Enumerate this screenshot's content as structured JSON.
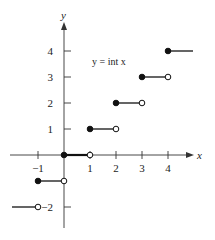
{
  "chart_data": {
    "type": "line",
    "title": "y = int x",
    "xlabel": "x",
    "ylabel": "y",
    "xlim": [
      -2,
      4.7
    ],
    "ylim": [
      -2.5,
      5
    ],
    "grid": false,
    "x_ticks": [
      -1,
      1,
      2,
      3,
      4
    ],
    "x_tick_labels": [
      "−1",
      "1",
      "2",
      "3",
      "4"
    ],
    "y_ticks": [
      1,
      2,
      3,
      4,
      -2
    ],
    "y_tick_labels": [
      "1",
      "2",
      "3",
      "4",
      "−2"
    ],
    "segments": [
      {
        "x_start": -2,
        "x_end": -1,
        "y": -2,
        "left_closed": false,
        "right_closed": false,
        "left_visible": false
      },
      {
        "x_start": -1,
        "x_end": 0,
        "y": -1,
        "left_closed": true,
        "right_closed": false
      },
      {
        "x_start": 0,
        "x_end": 1,
        "y": 0,
        "left_closed": true,
        "right_closed": false
      },
      {
        "x_start": 1,
        "x_end": 2,
        "y": 1,
        "left_closed": true,
        "right_closed": false
      },
      {
        "x_start": 2,
        "x_end": 3,
        "y": 2,
        "left_closed": true,
        "right_closed": false
      },
      {
        "x_start": 3,
        "x_end": 4,
        "y": 3,
        "left_closed": true,
        "right_closed": false
      },
      {
        "x_start": 4,
        "x_end": 5,
        "y": 4,
        "left_closed": true,
        "right_closed": false,
        "right_visible": false
      }
    ],
    "annotations": [
      {
        "text": "y = int x",
        "x": 1.4,
        "y": 3.5
      }
    ]
  },
  "labels": {
    "equation": "y = int x",
    "x_axis": "x",
    "y_axis": "y"
  },
  "colors": {
    "axis": "#333333",
    "step": "#111111",
    "background": "#ffffff"
  }
}
